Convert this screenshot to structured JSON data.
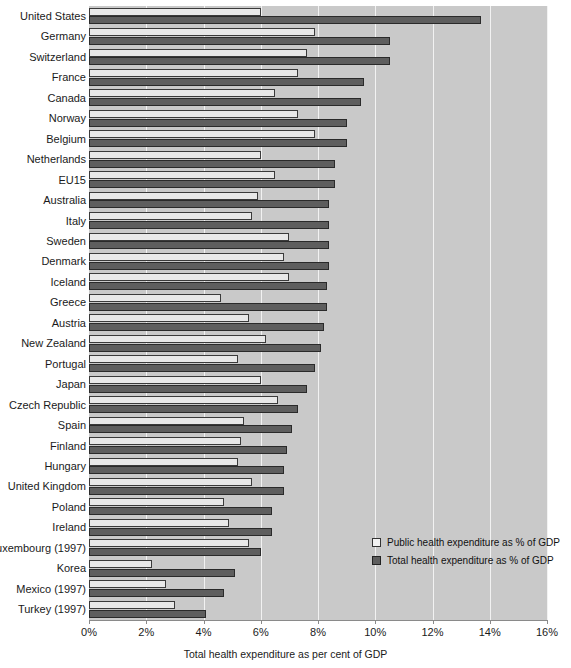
{
  "chart_data": {
    "type": "bar",
    "orientation": "horizontal",
    "title": "",
    "xlabel": "Total health expenditure as per cent of GDP",
    "ylabel": "",
    "xlim": [
      0,
      16
    ],
    "xticks": [
      0,
      2,
      4,
      6,
      8,
      10,
      12,
      14,
      16
    ],
    "xtick_labels": [
      "0%",
      "2%",
      "4%",
      "6%",
      "8%",
      "10%",
      "12%",
      "14%",
      "16%"
    ],
    "grid": true,
    "legend_position": "inside-lower-right",
    "categories": [
      "United States",
      "Germany",
      "Switzerland",
      "France",
      "Canada",
      "Norway",
      "Belgium",
      "Netherlands",
      "EU15",
      "Australia",
      "Italy",
      "Sweden",
      "Denmark",
      "Iceland",
      "Greece",
      "Austria",
      "New Zealand",
      "Portugal",
      "Japan",
      "Czech Republic",
      "Spain",
      "Finland",
      "Hungary",
      "United Kingdom",
      "Poland",
      "Ireland",
      "Luxembourg (1997)",
      "Korea",
      "Mexico (1997)",
      "Turkey (1997)"
    ],
    "series": [
      {
        "name": "Public health expenditure as % of GDP",
        "color": "#e8e8e8",
        "values": [
          6.0,
          7.9,
          7.6,
          7.3,
          6.5,
          7.3,
          7.9,
          6.0,
          6.5,
          5.9,
          5.7,
          7.0,
          6.8,
          7.0,
          4.6,
          5.6,
          6.2,
          5.2,
          6.0,
          6.6,
          5.4,
          5.3,
          5.2,
          5.7,
          4.7,
          4.9,
          5.6,
          2.2,
          2.7,
          3.0
        ]
      },
      {
        "name": "Total health expenditure as % of GDP",
        "color": "#5e5e5e",
        "values": [
          13.7,
          10.5,
          10.5,
          9.6,
          9.5,
          9.0,
          9.0,
          8.6,
          8.6,
          8.4,
          8.4,
          8.4,
          8.4,
          8.3,
          8.3,
          8.2,
          8.1,
          7.9,
          7.6,
          7.3,
          7.1,
          6.9,
          6.8,
          6.8,
          6.4,
          6.4,
          6.0,
          5.1,
          4.7,
          4.1
        ]
      }
    ]
  },
  "legend": {
    "items": [
      {
        "label": "Public health expenditure as % of GDP",
        "swatch": "public"
      },
      {
        "label": "Total health expenditure as % of GDP",
        "swatch": "total"
      }
    ]
  }
}
